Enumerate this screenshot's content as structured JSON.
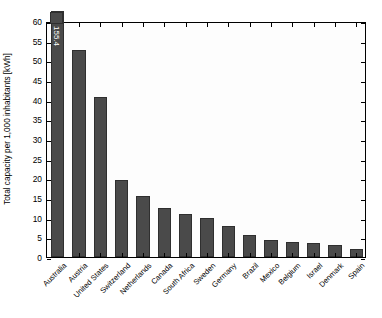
{
  "chart_data": {
    "type": "bar",
    "title": "",
    "xlabel": "",
    "ylabel": "Total capacity per 1,000 inhabitants [kWh]",
    "ylim": [
      0,
      60
    ],
    "ytick_labels": [
      "0",
      "5",
      "10",
      "15",
      "20",
      "25",
      "30",
      "35",
      "40",
      "45",
      "50",
      "55",
      "60"
    ],
    "ytick_values": [
      0,
      5,
      10,
      15,
      20,
      25,
      30,
      35,
      40,
      45,
      50,
      55,
      60
    ],
    "grid": false,
    "legend": null,
    "categories": [
      "Australia",
      "Austria",
      "United States",
      "Switzerland",
      "Netherlands",
      "Canada",
      "South Africa",
      "Sweden",
      "Germany",
      "Brazil",
      "Mexico",
      "Belgium",
      "Israel",
      "Denmark",
      "Spain"
    ],
    "values": [
      155.4,
      52.6,
      40.7,
      19.5,
      15.5,
      12.4,
      11.0,
      9.8,
      8.0,
      5.6,
      4.4,
      3.9,
      3.6,
      3.1,
      2.0
    ],
    "clipped_bar_index": 0,
    "annotations": [
      {
        "index": 0,
        "text": "155.4"
      }
    ],
    "bar_color": "#4a4a4a",
    "bar_edge_color": "#2f2f2f",
    "background_color": "#ffffff",
    "axis_color": "#000000"
  }
}
